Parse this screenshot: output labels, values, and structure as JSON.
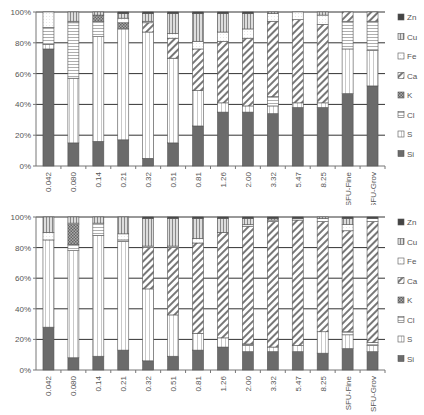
{
  "chart_data": [
    {
      "type": "bar",
      "stacked": true,
      "percent": true,
      "title": "",
      "xlabel": "",
      "ylabel": "",
      "ylim": [
        0,
        100
      ],
      "yticks": [
        "0%",
        "20%",
        "40%",
        "60%",
        "80%",
        "100%"
      ],
      "grid": true,
      "legend_position": "right",
      "categories": [
        "0.042",
        "0.080",
        "0.14",
        "0.21",
        "0.32",
        "0.51",
        "0.81",
        "1.26",
        "2.00",
        "3.32",
        "5.47",
        "8.25",
        "SFU-Fine",
        "SFU-Grov"
      ],
      "series": [
        {
          "name": "Si",
          "values": [
            76,
            15,
            16,
            17,
            5,
            15,
            26,
            35,
            35,
            34,
            38,
            38,
            47,
            52
          ]
        },
        {
          "name": "S",
          "values": [
            3,
            42,
            68,
            72,
            82,
            55,
            23,
            6,
            4,
            5,
            3,
            3,
            29,
            23
          ]
        },
        {
          "name": "Cl",
          "values": [
            11,
            36,
            10,
            0,
            0,
            0,
            0,
            0,
            0,
            6,
            0,
            0,
            18,
            19
          ]
        },
        {
          "name": "K",
          "values": [
            0,
            0,
            4,
            4,
            0,
            0,
            0,
            0,
            0,
            0,
            0,
            0,
            0,
            0
          ]
        },
        {
          "name": "Ca",
          "values": [
            0,
            0,
            0,
            0,
            6,
            13,
            27,
            40,
            44,
            49,
            54,
            51,
            6,
            6
          ]
        },
        {
          "name": "Fe",
          "values": [
            10,
            1,
            0,
            3,
            1,
            3,
            5,
            6,
            6,
            5,
            5,
            6,
            0,
            0
          ]
        },
        {
          "name": "Cu",
          "values": [
            0,
            6,
            2,
            3,
            5,
            13,
            18,
            12,
            10,
            1,
            0,
            2,
            0,
            0
          ]
        },
        {
          "name": "Zn",
          "values": [
            0,
            0,
            0,
            1,
            1,
            1,
            1,
            1,
            1,
            0,
            0,
            0,
            0,
            0
          ]
        }
      ]
    },
    {
      "type": "bar",
      "stacked": true,
      "percent": true,
      "title": "",
      "xlabel": "",
      "ylabel": "",
      "ylim": [
        0,
        100
      ],
      "yticks": [
        "0%",
        "20%",
        "40%",
        "60%",
        "80%",
        "100%"
      ],
      "grid": true,
      "legend_position": "right",
      "categories": [
        "0.042",
        "0.080",
        "0.14",
        "0.21",
        "0.32",
        "0.51",
        "0.81",
        "1.26",
        "2.00",
        "3.32",
        "5.47",
        "8.25",
        "SFU-Fine",
        "SFU-Grov"
      ],
      "series": [
        {
          "name": "Si",
          "values": [
            28,
            8,
            9,
            13,
            6,
            9,
            13,
            15,
            12,
            12,
            12,
            11,
            14,
            12
          ]
        },
        {
          "name": "S",
          "values": [
            57,
            70,
            79,
            71,
            47,
            27,
            11,
            6,
            4,
            3,
            4,
            14,
            9,
            4
          ]
        },
        {
          "name": "Cl",
          "values": [
            0,
            4,
            8,
            1,
            0,
            0,
            0,
            0,
            1,
            0,
            0,
            0,
            2,
            2
          ]
        },
        {
          "name": "K",
          "values": [
            0,
            13,
            0,
            0,
            0,
            0,
            0,
            0,
            0,
            0,
            0,
            0,
            0,
            0
          ]
        },
        {
          "name": "Ca",
          "values": [
            0,
            0,
            0,
            0,
            27,
            44,
            59,
            69,
            77,
            82,
            82,
            72,
            66,
            79
          ]
        },
        {
          "name": "Fe",
          "values": [
            5,
            1,
            0,
            4,
            1,
            1,
            3,
            0,
            1,
            1,
            1,
            2,
            4,
            2
          ]
        },
        {
          "name": "Cu",
          "values": [
            10,
            4,
            4,
            11,
            18,
            18,
            13,
            9,
            4,
            1,
            0,
            1,
            4,
            0
          ]
        },
        {
          "name": "Zn",
          "values": [
            0,
            0,
            0,
            0,
            1,
            1,
            1,
            1,
            1,
            1,
            1,
            0,
            1,
            1
          ]
        }
      ]
    }
  ],
  "legend": [
    {
      "name": "Zn",
      "pattern": "dark-box",
      "icon": "zn-legend-swatch"
    },
    {
      "name": "Cu",
      "pattern": "vertical-lines",
      "icon": "cu-legend-swatch"
    },
    {
      "name": "Fe",
      "pattern": "dotted-light",
      "icon": "fe-legend-swatch"
    },
    {
      "name": "Ca",
      "pattern": "diagonal-stripes",
      "icon": "ca-legend-swatch"
    },
    {
      "name": "K",
      "pattern": "checker",
      "icon": "k-legend-swatch"
    },
    {
      "name": "Cl",
      "pattern": "horizontal-lines",
      "icon": "cl-legend-swatch"
    },
    {
      "name": "S",
      "pattern": "vertical-thin",
      "icon": "s-legend-swatch"
    },
    {
      "name": "Si",
      "pattern": "solid-dark",
      "icon": "si-legend-swatch"
    }
  ],
  "colors": {
    "Si": "#6b6b6b",
    "grid": "#333333",
    "axis": "#777777",
    "stroke": "#555555"
  }
}
